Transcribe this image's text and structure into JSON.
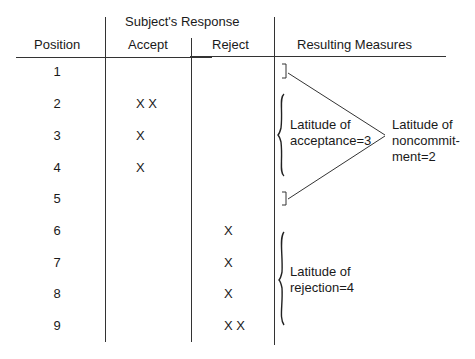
{
  "table": {
    "headers": {
      "position": "Position",
      "group": "Subject's Response",
      "accept": "Accept",
      "reject": "Reject",
      "measures": "Resulting Measures"
    },
    "rows": [
      {
        "position": "1",
        "accept": "",
        "reject": ""
      },
      {
        "position": "2",
        "accept": "X X",
        "reject": ""
      },
      {
        "position": "3",
        "accept": "X",
        "reject": ""
      },
      {
        "position": "4",
        "accept": "X",
        "reject": ""
      },
      {
        "position": "5",
        "accept": "",
        "reject": ""
      },
      {
        "position": "6",
        "accept": "",
        "reject": "X"
      },
      {
        "position": "7",
        "accept": "",
        "reject": "X"
      },
      {
        "position": "8",
        "accept": "",
        "reject": "X"
      },
      {
        "position": "9",
        "accept": "",
        "reject": "X X"
      }
    ]
  },
  "measures": {
    "acceptance": {
      "line1": "Latitude of",
      "line2": "acceptance=3"
    },
    "noncommitment": {
      "line1": "Latitude of",
      "line2": "noncommit-",
      "line3": "ment=2"
    },
    "rejection": {
      "line1": "Latitude of",
      "line2": "rejection=4"
    }
  }
}
